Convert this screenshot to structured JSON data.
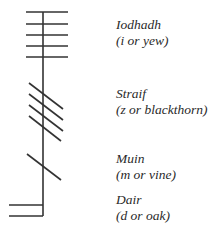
{
  "diagram": {
    "type": "ogham-letter-chart",
    "stroke_color": "#333333",
    "letters": [
      {
        "name": "Iodhadh",
        "meaning": "(i or yew)",
        "strokes": 5,
        "stroke_type": "across"
      },
      {
        "name": "Straif",
        "meaning": "(z or blackthorn)",
        "strokes": 4,
        "stroke_type": "diagonal"
      },
      {
        "name": "Muin",
        "meaning": "(m or vine)",
        "strokes": 1,
        "stroke_type": "diagonal"
      },
      {
        "name": "Dair",
        "meaning": "(d or oak)",
        "strokes": 2,
        "stroke_type": "left"
      }
    ]
  }
}
